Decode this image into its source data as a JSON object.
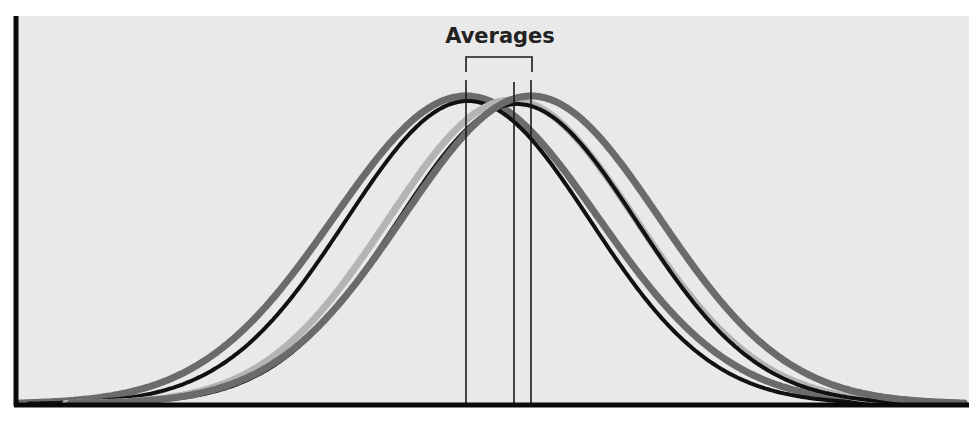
{
  "chart_data": {
    "type": "line",
    "title": "",
    "annotation": "Averages",
    "xlabel": "",
    "ylabel": "",
    "grid": false,
    "legend": null,
    "x_range": [
      0,
      969
    ],
    "series": [
      {
        "name": "distribution-1",
        "color": "#6b6b6b",
        "width": 7,
        "mean_px": 466,
        "sigma_px": 132,
        "peak_y_px": 96
      },
      {
        "name": "distribution-2",
        "color": "#111111",
        "width": 4,
        "mean_px": 468,
        "sigma_px": 122,
        "peak_y_px": 101
      },
      {
        "name": "distribution-3",
        "color": "#b4b4b4",
        "width": 7,
        "mean_px": 512,
        "sigma_px": 124,
        "peak_y_px": 100
      },
      {
        "name": "distribution-4",
        "color": "#111111",
        "width": 4,
        "mean_px": 517,
        "sigma_px": 120,
        "peak_y_px": 104
      },
      {
        "name": "distribution-5",
        "color": "#6b6b6b",
        "width": 7,
        "mean_px": 531,
        "sigma_px": 128,
        "peak_y_px": 96
      }
    ],
    "average_lines_px": [
      466,
      514,
      531
    ],
    "bracket": {
      "x1": 466,
      "x2": 532,
      "y": 57,
      "drop_to": 72
    }
  },
  "labels": {
    "annotation": "Averages"
  },
  "colors": {
    "panel_bg": "#e9e9e9",
    "page_bg": "#ffffff",
    "axis": "#0a0a0a"
  }
}
